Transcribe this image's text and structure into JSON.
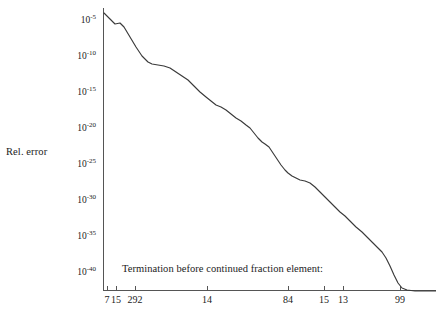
{
  "figure": {
    "background": "#ffffff",
    "line_color": "#3a3a3a",
    "axis_color": "#555555"
  },
  "axis": {
    "y_title": "Rel. error",
    "x_caption": "Termination before continued fraction element:"
  },
  "chart_data": {
    "type": "line",
    "title": "",
    "xlabel": "Termination before continued fraction element:",
    "ylabel": "Rel. error",
    "yscale": "log",
    "grid": false,
    "legend": null,
    "ylim": [
      1e-42,
      0.001
    ],
    "xlim": [
      0,
      100
    ],
    "y_tick_labels": [
      "10^-5",
      "10^-10",
      "10^-15",
      "10^-20",
      "10^-25",
      "10^-30",
      "10^-35",
      "10^-40"
    ],
    "y_tick_mantissa": [
      "10",
      "10",
      "10",
      "10",
      "10",
      "10",
      "10",
      "10"
    ],
    "y_tick_exponents": [
      "-5",
      "-10",
      "-15",
      "-20",
      "-25",
      "-30",
      "-35",
      "-40"
    ],
    "y_tick_values": [
      1e-05,
      1e-10,
      1e-15,
      1e-20,
      1e-25,
      1e-30,
      1e-35,
      1e-40
    ],
    "y_tick_pixel_y": [
      22,
      58,
      94,
      130,
      166,
      202,
      238,
      274
    ],
    "x_tick_labels": [
      "7",
      "15",
      "292",
      "14",
      "84",
      "15",
      "13",
      "99"
    ],
    "x_tick_pixel_x": [
      107,
      116,
      135,
      207,
      288,
      324,
      343,
      400
    ],
    "series": [
      {
        "name": "relative error",
        "points_pixel": [
          [
            104,
            13
          ],
          [
            110,
            19
          ],
          [
            115,
            24
          ],
          [
            120,
            23
          ],
          [
            124,
            27
          ],
          [
            130,
            37
          ],
          [
            136,
            47
          ],
          [
            142,
            56
          ],
          [
            148,
            62
          ],
          [
            152,
            64
          ],
          [
            158,
            65
          ],
          [
            164,
            66
          ],
          [
            170,
            68
          ],
          [
            176,
            72
          ],
          [
            182,
            76
          ],
          [
            188,
            80
          ],
          [
            194,
            86
          ],
          [
            200,
            92
          ],
          [
            206,
            97
          ],
          [
            211,
            101
          ],
          [
            216,
            105
          ],
          [
            221,
            107
          ],
          [
            226,
            110
          ],
          [
            231,
            114
          ],
          [
            236,
            118
          ],
          [
            241,
            121
          ],
          [
            246,
            125
          ],
          [
            250,
            128
          ],
          [
            254,
            133
          ],
          [
            258,
            138
          ],
          [
            262,
            142
          ],
          [
            265,
            144
          ],
          [
            269,
            147
          ],
          [
            273,
            153
          ],
          [
            277,
            159
          ],
          [
            281,
            165
          ],
          [
            285,
            170
          ],
          [
            288,
            173
          ],
          [
            292,
            176
          ],
          [
            296,
            178
          ],
          [
            300,
            180
          ],
          [
            305,
            181
          ],
          [
            310,
            183
          ],
          [
            315,
            187
          ],
          [
            320,
            192
          ],
          [
            325,
            197
          ],
          [
            330,
            202
          ],
          [
            335,
            207
          ],
          [
            340,
            212
          ],
          [
            345,
            216
          ],
          [
            350,
            221
          ],
          [
            356,
            227
          ],
          [
            362,
            232
          ],
          [
            368,
            238
          ],
          [
            373,
            243
          ],
          [
            378,
            248
          ],
          [
            382,
            252
          ],
          [
            386,
            258
          ],
          [
            390,
            266
          ],
          [
            394,
            275
          ],
          [
            398,
            283
          ],
          [
            402,
            288
          ],
          [
            407,
            290
          ],
          [
            415,
            291
          ],
          [
            425,
            291
          ],
          [
            436,
            291
          ]
        ],
        "approx_values": [
          0.0003,
          1e-05,
          6e-07,
          1e-06,
          1e-07,
          1e-09,
          1e-10,
          1e-11,
          1e-11,
          1e-11,
          2e-12,
          2e-12,
          1e-12,
          1e-13,
          1e-13,
          1e-14,
          1e-14,
          1e-15,
          1e-16,
          1e-16,
          1e-17,
          1e-17,
          1e-18,
          1e-18,
          1e-19,
          1e-19,
          1e-20,
          1e-20,
          1e-21,
          1e-22,
          1e-22,
          1e-22,
          1e-23,
          1e-24,
          1e-25,
          1e-25,
          1e-26,
          1e-26,
          1e-26,
          1e-26,
          1e-26,
          1e-27,
          1e-27,
          1e-27,
          1e-28,
          1e-29,
          1e-30,
          1e-30,
          1e-31,
          1e-32,
          1e-32,
          1e-33,
          1e-34,
          1e-35,
          1e-35,
          1e-36,
          1e-37,
          1e-38,
          1e-39,
          1e-40,
          1e-41,
          1e-42,
          1e-42,
          1e-42,
          1e-42,
          1e-42
        ]
      }
    ]
  }
}
